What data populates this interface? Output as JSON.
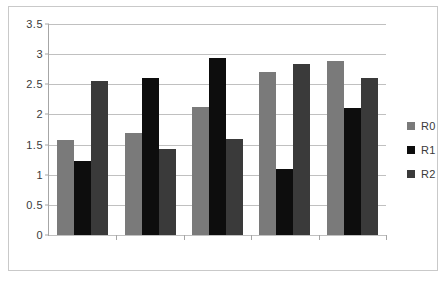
{
  "chart_data": {
    "type": "bar",
    "title": "",
    "subtitle": "",
    "xlabel": "",
    "ylabel": "",
    "categories": [
      "1",
      "2",
      "3",
      "4",
      "5"
    ],
    "series": [
      {
        "name": "R0",
        "color": "#7a7a7a",
        "values": [
          1.57,
          1.69,
          2.12,
          2.71,
          2.88
        ]
      },
      {
        "name": "R1",
        "color": "#0d0d0d",
        "values": [
          1.22,
          2.6,
          2.93,
          1.1,
          2.11
        ]
      },
      {
        "name": "R2",
        "color": "#3a3a3a",
        "values": [
          2.55,
          1.43,
          1.6,
          2.83,
          2.61
        ]
      }
    ],
    "ylim": [
      0,
      3.5
    ],
    "yticks": [
      0,
      0.5,
      1,
      1.5,
      2,
      2.5,
      3,
      3.5
    ],
    "ytick_labels": [
      "0",
      "0.5",
      "1",
      "1.5",
      "2",
      "2.5",
      "3",
      "3.5"
    ],
    "xtick_labels": [
      "",
      "",
      "",
      "",
      ""
    ],
    "grid": "horizontal",
    "legend_position": "right",
    "gridline_color": "#c0c0c0",
    "axis_color": "#a6a6a6",
    "frame_color": "#c9c9c9",
    "background": "#ffffff"
  }
}
